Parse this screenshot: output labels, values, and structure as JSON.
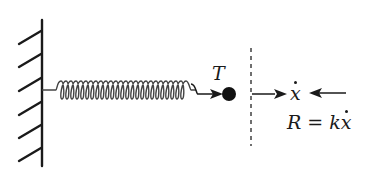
{
  "diagram": {
    "type": "spring-damper free body diagram",
    "wall": {
      "x": 42,
      "y_top": 20,
      "y_bottom": 166,
      "hatch_count": 6,
      "hatch_side": "left"
    },
    "spring": {
      "x_start": 42,
      "x_end": 195,
      "y": 90,
      "coil_count": 13
    },
    "mass": {
      "label": "T",
      "x": 229,
      "y": 93,
      "shape": "filled-circle"
    },
    "cut_line": {
      "x": 251,
      "y_top": 48,
      "y_bottom": 145,
      "style": "dashed"
    },
    "velocity": {
      "symbol": "x",
      "dot": true,
      "label": "ẋ"
    },
    "resistance": {
      "label_lhs": "R",
      "equals": "=",
      "label_rhs_coef": "k",
      "label_rhs_var": "x",
      "full": "R = kẋ"
    },
    "colors": {
      "stroke": "#1a1a1a",
      "spring": "#444444"
    }
  }
}
